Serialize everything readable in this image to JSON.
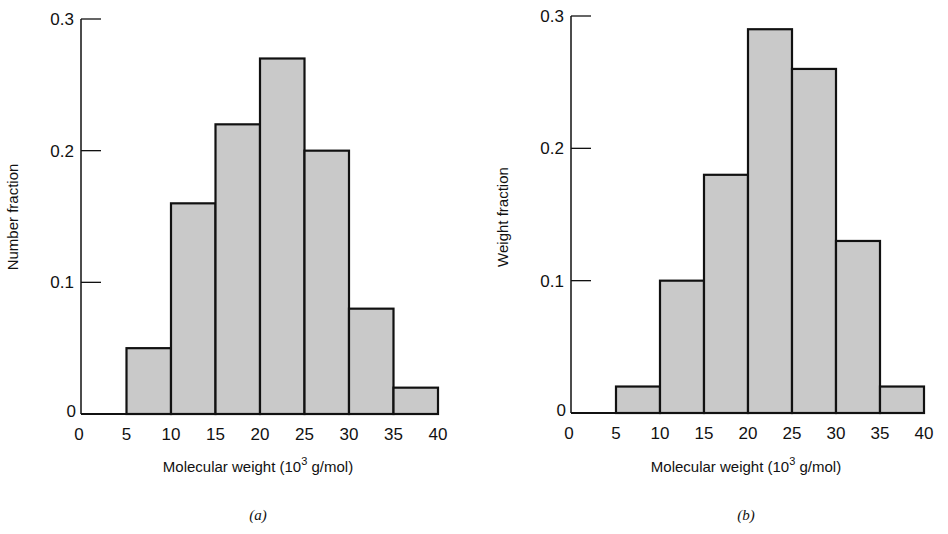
{
  "chart_data": [
    {
      "type": "bar",
      "panel_label": "(a)",
      "title": "",
      "xlabel": "Molecular weight (10^3 g/mol)",
      "xlabel_main": "Molecular weight (10",
      "xlabel_sup": "3",
      "xlabel_tail": " g/mol)",
      "ylabel": "Number fraction",
      "x_ticks": [
        "0",
        "5",
        "10",
        "15",
        "20",
        "25",
        "30",
        "35",
        "40"
      ],
      "y_ticks": [
        "0",
        "0.1",
        "0.2",
        "0.3"
      ],
      "xlim": [
        0,
        40
      ],
      "ylim": [
        0,
        0.3
      ],
      "grid": false,
      "bins": [
        "5-10",
        "10-15",
        "15-20",
        "20-25",
        "25-30",
        "30-35",
        "35-40"
      ],
      "bin_edges": [
        [
          5,
          10
        ],
        [
          10,
          15
        ],
        [
          15,
          20
        ],
        [
          20,
          25
        ],
        [
          25,
          30
        ],
        [
          30,
          35
        ],
        [
          35,
          40
        ]
      ],
      "values": [
        0.05,
        0.16,
        0.22,
        0.27,
        0.2,
        0.08,
        0.02
      ]
    },
    {
      "type": "bar",
      "panel_label": "(b)",
      "title": "",
      "xlabel": "Molecular weight (10^3 g/mol)",
      "xlabel_main": "Molecular weight (10",
      "xlabel_sup": "3",
      "xlabel_tail": " g/mol)",
      "ylabel": "Weight fraction",
      "x_ticks": [
        "0",
        "5",
        "10",
        "15",
        "20",
        "25",
        "30",
        "35",
        "40"
      ],
      "y_ticks": [
        "0",
        "0.1",
        "0.2",
        "0.3"
      ],
      "xlim": [
        0,
        40
      ],
      "ylim": [
        0,
        0.3
      ],
      "grid": false,
      "bins": [
        "5-10",
        "10-15",
        "15-20",
        "20-25",
        "25-30",
        "30-35",
        "35-40"
      ],
      "bin_edges": [
        [
          5,
          10
        ],
        [
          10,
          15
        ],
        [
          15,
          20
        ],
        [
          20,
          25
        ],
        [
          25,
          30
        ],
        [
          30,
          35
        ],
        [
          35,
          40
        ]
      ],
      "values": [
        0.02,
        0.1,
        0.18,
        0.29,
        0.26,
        0.13,
        0.02
      ]
    }
  ],
  "style": {
    "bar_fill": "#c9c9c9",
    "bar_stroke": "#111111",
    "axis_color": "#111111"
  }
}
